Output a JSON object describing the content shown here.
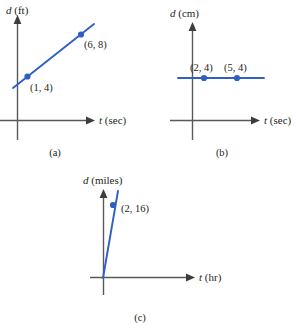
{
  "figure": {
    "panels": [
      {
        "caption": "(a)",
        "y_axis_label_var": "d",
        "y_axis_label_unit": " (ft)",
        "x_axis_label_var": "t",
        "x_axis_label_unit": " (sec)",
        "points": [
          {
            "label": "(1, 4)",
            "x": 1,
            "y": 4
          },
          {
            "label": "(6, 8)",
            "x": 6,
            "y": 8
          }
        ],
        "line_type": "increasing-line"
      },
      {
        "caption": "(b)",
        "y_axis_label_var": "d",
        "y_axis_label_unit": " (cm)",
        "x_axis_label_var": "t",
        "x_axis_label_unit": " (sec)",
        "points": [
          {
            "label": "(2, 4)",
            "x": 2,
            "y": 4
          },
          {
            "label": "(5, 4)",
            "x": 5,
            "y": 4
          }
        ],
        "line_type": "horizontal-line"
      },
      {
        "caption": "(c)",
        "y_axis_label_var": "d",
        "y_axis_label_unit": " (miles)",
        "x_axis_label_var": "t",
        "x_axis_label_unit": " (hr)",
        "points": [
          {
            "label": "(2, 16)",
            "x": 2,
            "y": 16
          }
        ],
        "line_type": "steep-line-through-origin"
      }
    ],
    "colors": {
      "data": "#2f5fc4",
      "axis": "#595959",
      "text": "#231f20",
      "background": "#ffffff"
    }
  }
}
